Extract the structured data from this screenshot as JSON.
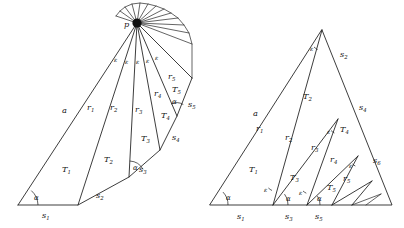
{
  "figure": {
    "title": "",
    "caption": "",
    "panels": [
      {
        "id": "left-panel",
        "name": "fan-polygon-figure",
        "apex_label": "p",
        "triangle_labels": [
          "T_1",
          "T_2",
          "T_3",
          "T_4",
          "T_5"
        ],
        "side_labels": [
          "s_1",
          "s_2",
          "s_3",
          "s_4",
          "s_5"
        ],
        "ray_labels": [
          "a",
          "r_1",
          "r_2",
          "r_3",
          "r_4",
          "r_5"
        ],
        "angle_labels": [
          "alpha",
          "alpha",
          "alpha"
        ],
        "epsilon_labels": [
          "epsilon",
          "epsilon",
          "epsilon",
          "epsilon",
          "epsilon"
        ]
      },
      {
        "id": "right-panel",
        "name": "nested-triangle-figure",
        "triangle_labels": [
          "T_1",
          "T_2",
          "T_3",
          "T_4",
          "T_5"
        ],
        "side_labels": [
          "s_1",
          "s_2",
          "s_3",
          "s_4",
          "s_5",
          "s_6"
        ],
        "ray_labels": [
          "a",
          "r_1",
          "r_2",
          "r_3",
          "r_4",
          "r_5"
        ],
        "angle_labels": [
          "alpha",
          "alpha",
          "alpha"
        ],
        "epsilon_labels": [
          "epsilon",
          "epsilon",
          "epsilon",
          "epsilon",
          "epsilon"
        ]
      }
    ]
  },
  "glyphs": {
    "alpha": "α",
    "epsilon": "ε",
    "p": "p",
    "a": "a",
    "T": "T",
    "s": "s",
    "r": "r",
    "one": "1",
    "two": "2",
    "three": "3",
    "four": "4",
    "five": "5",
    "six": "6"
  },
  "colors": {
    "stroke": "#1a1a1a",
    "background": "#ffffff",
    "text": "#141414"
  },
  "left": {
    "apex": "p",
    "a": "a",
    "r1": "r",
    "r1s": "1",
    "r2": "r",
    "r2s": "2",
    "r3": "r",
    "r3s": "3",
    "r4": "r",
    "r4s": "4",
    "r5": "r",
    "r5s": "5",
    "T1": "T",
    "T1s": "1",
    "T2": "T",
    "T2s": "2",
    "T3": "T",
    "T3s": "3",
    "T4": "T",
    "T4s": "4",
    "T5": "T",
    "T5s": "5",
    "s1": "s",
    "s1s": "1",
    "s2": "s",
    "s2s": "2",
    "s3": "s",
    "s3s": "3",
    "s4": "s",
    "s4s": "4",
    "s5": "s",
    "s5s": "5",
    "alpha1": "α",
    "alpha2": "α",
    "alpha3": "α",
    "eps1": "ε",
    "eps2": "ε",
    "eps3": "ε",
    "eps4": "ε",
    "eps5": "ε"
  },
  "right": {
    "a": "a",
    "r1": "r",
    "r1s": "1",
    "r2": "r",
    "r2s": "2",
    "r3": "r",
    "r3s": "3",
    "r4": "r",
    "r4s": "4",
    "r5": "r",
    "r5s": "5",
    "T1": "T",
    "T1s": "1",
    "T2": "T",
    "T2s": "2",
    "T3": "T",
    "T3s": "3",
    "T4": "T",
    "T4s": "4",
    "T5": "T",
    "T5s": "5",
    "s1": "s",
    "s1s": "1",
    "s2": "s",
    "s2s": "2",
    "s3": "s",
    "s3s": "3",
    "s4": "s",
    "s4s": "4",
    "s5": "s",
    "s5s": "5",
    "s6": "s",
    "s6s": "6",
    "alpha1": "α",
    "alpha2": "α",
    "alpha3": "α",
    "eps1": "ε",
    "eps2": "ε",
    "eps3": "ε",
    "eps4": "ε",
    "eps5": "ε"
  }
}
